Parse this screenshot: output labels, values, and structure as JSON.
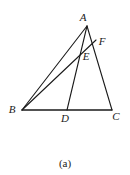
{
  "figure": {
    "caption": "(a)",
    "stroke_color": "#1a1a1a",
    "label_color": "#1a1a1a",
    "background_color": "#ffffff",
    "points": [
      {
        "id": "A",
        "label": "A",
        "x": 87,
        "y": 26,
        "label_x": 83,
        "label_y": 21
      },
      {
        "id": "B",
        "label": "B",
        "x": 22,
        "y": 110,
        "label_x": 12,
        "label_y": 113
      },
      {
        "id": "C",
        "label": "C",
        "x": 112,
        "y": 110,
        "label_x": 114,
        "label_y": 120
      },
      {
        "id": "D",
        "label": "D",
        "x": 67,
        "y": 110,
        "label_x": 63,
        "label_y": 122
      },
      {
        "id": "E",
        "label": "E",
        "x": 80,
        "y": 52,
        "label_x": 84,
        "label_y": 60
      },
      {
        "id": "F",
        "label": "F",
        "x": 96,
        "y": 40,
        "label_x": 100,
        "label_y": 45
      }
    ],
    "segments": [
      {
        "name": "segment-BC",
        "from": "B",
        "to": "C"
      },
      {
        "name": "segment-BA",
        "from": "B",
        "to": "A"
      },
      {
        "name": "segment-BF",
        "from": "B",
        "to": "F"
      },
      {
        "name": "segment-AD",
        "from": "A",
        "to": "D"
      },
      {
        "name": "segment-AC",
        "from": "A",
        "to": "C"
      }
    ]
  }
}
